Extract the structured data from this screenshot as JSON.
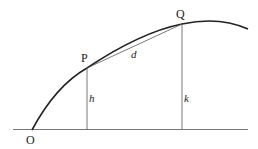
{
  "diagram": {
    "points": {
      "O": {
        "label": "O"
      },
      "P": {
        "label": "P"
      },
      "Q": {
        "label": "Q"
      }
    },
    "segments": {
      "h": {
        "label": "h"
      },
      "k": {
        "label": "k"
      },
      "d": {
        "label": "d"
      }
    },
    "colors": {
      "curve": "#222222",
      "thin_line": "#555555",
      "background": "#ffffff"
    }
  }
}
